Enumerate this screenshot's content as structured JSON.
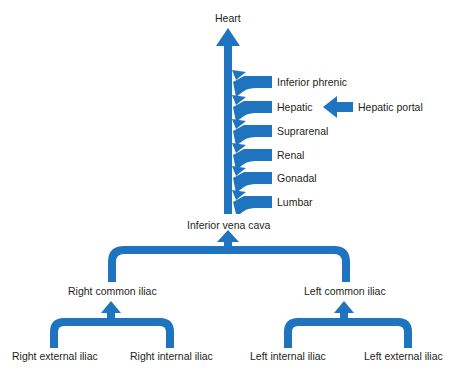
{
  "diagram": {
    "accent_color": "#1f74c0",
    "nodes": {
      "heart": "Heart",
      "ivc": "Inferior vena cava",
      "tributaries": [
        "Inferior phrenic",
        "Hepatic",
        "Suprarenal",
        "Renal",
        "Gonadal",
        "Lumbar"
      ],
      "hepatic_portal": "Hepatic portal",
      "right_common_iliac": "Right common iliac",
      "left_common_iliac": "Left common iliac",
      "right_external_iliac": "Right external iliac",
      "right_internal_iliac": "Right internal iliac",
      "left_internal_iliac": "Left internal iliac",
      "left_external_iliac": "Left external iliac"
    },
    "flows": [
      {
        "from": "Inferior phrenic",
        "to": "Inferior vena cava"
      },
      {
        "from": "Hepatic portal",
        "to": "Hepatic"
      },
      {
        "from": "Hepatic",
        "to": "Inferior vena cava"
      },
      {
        "from": "Suprarenal",
        "to": "Inferior vena cava"
      },
      {
        "from": "Renal",
        "to": "Inferior vena cava"
      },
      {
        "from": "Gonadal",
        "to": "Inferior vena cava"
      },
      {
        "from": "Lumbar",
        "to": "Inferior vena cava"
      },
      {
        "from": "Inferior vena cava",
        "to": "Heart"
      },
      {
        "from": "Right common iliac",
        "to": "Inferior vena cava"
      },
      {
        "from": "Left common iliac",
        "to": "Inferior vena cava"
      },
      {
        "from": "Right external iliac",
        "to": "Right common iliac"
      },
      {
        "from": "Right internal iliac",
        "to": "Right common iliac"
      },
      {
        "from": "Left internal iliac",
        "to": "Left common iliac"
      },
      {
        "from": "Left external iliac",
        "to": "Left common iliac"
      }
    ]
  }
}
